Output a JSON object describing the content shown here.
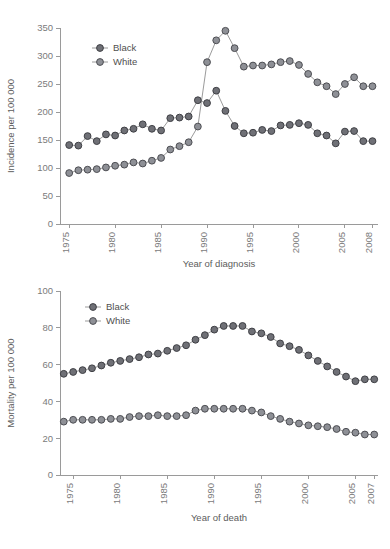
{
  "figure": {
    "background": "#ffffff",
    "line_color": "#9b9b9b",
    "axis_color": "#9a9a9a",
    "tick_text_color": "#7b7b7b"
  },
  "chart_data": [
    {
      "id": "incidence",
      "type": "line",
      "title": "",
      "xlabel": "Year of diagnosis",
      "ylabel": "Incidence per 100 000",
      "xlim": [
        1974,
        2008.6
      ],
      "ylim": [
        0,
        350
      ],
      "yticks": [
        0,
        50,
        100,
        150,
        200,
        250,
        300,
        350
      ],
      "xticks": [
        1975,
        1980,
        1985,
        1990,
        1995,
        2000,
        2005,
        2008
      ],
      "grid": false,
      "legend_position": "upper-left",
      "marker": "circle",
      "x": [
        1975,
        1976,
        1977,
        1978,
        1979,
        1980,
        1981,
        1982,
        1983,
        1984,
        1985,
        1986,
        1987,
        1988,
        1989,
        1990,
        1991,
        1992,
        1993,
        1994,
        1995,
        1996,
        1997,
        1998,
        1999,
        2000,
        2001,
        2002,
        2003,
        2004,
        2005,
        2006,
        2007,
        2008
      ],
      "series": [
        {
          "name": "Black",
          "marker_fill": "#6f7076",
          "marker_stroke": "#3f4045",
          "values": [
            141,
            140,
            157,
            148,
            160,
            158,
            167,
            170,
            178,
            170,
            167,
            189,
            190,
            192,
            221,
            216,
            238,
            202,
            175,
            162,
            163,
            168,
            166,
            176,
            177,
            180,
            177,
            162,
            158,
            144,
            165,
            166,
            148,
            148
          ]
        },
        {
          "name": "White",
          "marker_fill": "#8e9096",
          "marker_stroke": "#4d4e53",
          "values": [
            91,
            96,
            97,
            98,
            101,
            104,
            106,
            110,
            108,
            113,
            118,
            133,
            139,
            146,
            174,
            289,
            328,
            345,
            314,
            281,
            283,
            283,
            285,
            289,
            291,
            284,
            268,
            253,
            246,
            232,
            250,
            262,
            246,
            246
          ]
        }
      ],
      "legend": [
        "Black",
        "White"
      ]
    },
    {
      "id": "mortality",
      "type": "line",
      "title": "",
      "xlabel": "Year of death",
      "ylabel": "Mortality per 100 000",
      "xlim": [
        1973.6,
        2007.4
      ],
      "ylim": [
        0,
        100
      ],
      "yticks": [
        0,
        20,
        40,
        60,
        80,
        100
      ],
      "xticks": [
        1975,
        1980,
        1985,
        1990,
        1995,
        2000,
        2005,
        2007
      ],
      "grid": false,
      "legend_position": "upper-left",
      "marker": "circle",
      "x": [
        1974,
        1975,
        1976,
        1977,
        1978,
        1979,
        1980,
        1981,
        1982,
        1983,
        1984,
        1985,
        1986,
        1987,
        1988,
        1989,
        1990,
        1991,
        1992,
        1993,
        1994,
        1995,
        1996,
        1997,
        1998,
        1999,
        2000,
        2001,
        2002,
        2003,
        2004,
        2005,
        2006,
        2007
      ],
      "series": [
        {
          "name": "Black",
          "marker_fill": "#6f7076",
          "marker_stroke": "#3f4045",
          "values": [
            55,
            56,
            57,
            58,
            59.5,
            61,
            62,
            63,
            64,
            65.5,
            66,
            67.5,
            69,
            70.5,
            73.5,
            76,
            79,
            81,
            81,
            81,
            78,
            77,
            75,
            71.5,
            70,
            68,
            65,
            62,
            59,
            56,
            53.5,
            51,
            52,
            52
          ]
        },
        {
          "name": "White",
          "marker_fill": "#8e9096",
          "marker_stroke": "#4d4e53",
          "values": [
            29,
            30,
            30,
            30,
            30,
            30.5,
            30.5,
            31.5,
            32,
            32,
            32.5,
            32,
            32,
            32.5,
            35,
            36,
            36,
            36,
            36,
            36,
            35,
            34,
            32,
            30.5,
            29,
            28,
            27,
            26.5,
            26,
            25,
            23.5,
            23,
            22,
            22
          ]
        }
      ],
      "legend": [
        "Black",
        "White"
      ]
    }
  ]
}
